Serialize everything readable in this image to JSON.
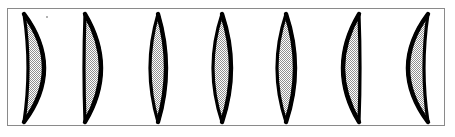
{
  "figure": {
    "frame": {
      "x": 7,
      "y": 8,
      "width": 438,
      "height": 118,
      "border_color": "#8a8a8a",
      "border_width": 1,
      "background_color": "#ffffff"
    },
    "style": {
      "outline_color": "#000000",
      "fill_pattern": "halftone-checker-gray",
      "fill_color": "#a8a8a8",
      "fill_base_color": "#ffffff",
      "outline_width_max": 3.2
    },
    "shape_count": 7,
    "artifacts": [
      {
        "name": "speck",
        "x": 46,
        "y": 16,
        "size": 2,
        "color": "#9a9a9a"
      }
    ],
    "shapes": [
      {
        "index": 1,
        "name": "crescent-right-bulging",
        "top_x": 24,
        "bottom_x": 24,
        "top_y": 14,
        "bottom_y": 122,
        "outer_bulge": 20,
        "inner_bulge": 4,
        "mid_left": 22,
        "mid_right": 39,
        "orientation": "right"
      },
      {
        "index": 2,
        "name": "lune-straight-left-edge",
        "top_x": 85,
        "bottom_x": 85,
        "top_y": 14,
        "bottom_y": 122,
        "outer_bulge": 16,
        "inner_bulge": -1,
        "mid_left": 84,
        "mid_right": 101,
        "orientation": "right"
      },
      {
        "index": 3,
        "name": "lens-symmetric-narrow",
        "top_x": 158,
        "bottom_x": 158,
        "top_y": 14,
        "bottom_y": 122,
        "outer_bulge": 8,
        "inner_bulge": -8,
        "mid_left": 150,
        "mid_right": 166,
        "orientation": "symmetric"
      },
      {
        "index": 4,
        "name": "lens-symmetric-wide",
        "top_x": 222,
        "bottom_x": 222,
        "top_y": 14,
        "bottom_y": 122,
        "outer_bulge": 9,
        "inner_bulge": -9,
        "mid_left": 213,
        "mid_right": 231,
        "orientation": "symmetric"
      },
      {
        "index": 5,
        "name": "lens-symmetric-wide-2",
        "top_x": 286,
        "bottom_x": 286,
        "top_y": 14,
        "bottom_y": 122,
        "outer_bulge": 9,
        "inner_bulge": -9,
        "mid_left": 277,
        "mid_right": 295,
        "orientation": "symmetric"
      },
      {
        "index": 6,
        "name": "lune-straight-right-edge",
        "top_x": 359,
        "bottom_x": 359,
        "top_y": 14,
        "bottom_y": 122,
        "outer_bulge": -16,
        "inner_bulge": 1,
        "mid_left": 343,
        "mid_right": 360,
        "orientation": "left"
      },
      {
        "index": 7,
        "name": "crescent-left-bulging",
        "top_x": 428,
        "bottom_x": 428,
        "top_y": 14,
        "bottom_y": 122,
        "outer_bulge": -20,
        "inner_bulge": -4,
        "mid_left": 408,
        "mid_right": 426,
        "orientation": "left"
      }
    ]
  }
}
